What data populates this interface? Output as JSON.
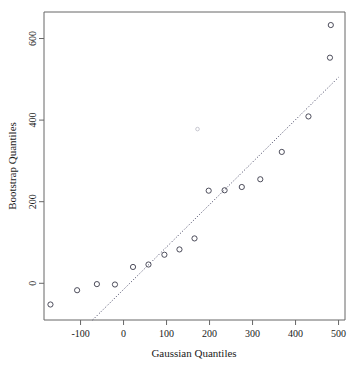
{
  "chart_data": {
    "type": "scatter",
    "title": "",
    "xlabel": "Gaussian Quantiles",
    "ylabel": "Bootstrap Quantiles",
    "xlim": [
      -185,
      515
    ],
    "ylim": [
      -90,
      665
    ],
    "grid": false,
    "legend": null,
    "xticks": [
      -100,
      0,
      100,
      200,
      300,
      400,
      500
    ],
    "xtick_labels": [
      "-100",
      "0",
      "100",
      "200",
      "300",
      "400",
      "500"
    ],
    "yticks": [
      0,
      200,
      400,
      600
    ],
    "ytick_labels": [
      "0",
      "200",
      "400",
      "600"
    ],
    "series": [
      {
        "name": "Bootstrap vs Gaussian quantiles",
        "marker": "open-circle",
        "color": "#3a3a4a",
        "x": [
          -170,
          -108,
          -62,
          -20,
          22,
          58,
          95,
          130,
          165,
          198,
          235,
          275,
          318,
          368,
          430,
          480,
          482
        ],
        "y": [
          -52,
          -17,
          -2,
          -3,
          40,
          46,
          70,
          83,
          110,
          227,
          228,
          236,
          255,
          322,
          409,
          553,
          633
        ]
      },
      {
        "name": "faint outlier",
        "marker": "open-circle-faint",
        "color": "#b9b9c4",
        "x": [
          172
        ],
        "y": [
          378
        ]
      }
    ],
    "reference_line": {
      "style": "dotted",
      "color": "#3a3a5a",
      "x": [
        -72,
        500
      ],
      "y": [
        -90,
        505
      ]
    }
  }
}
